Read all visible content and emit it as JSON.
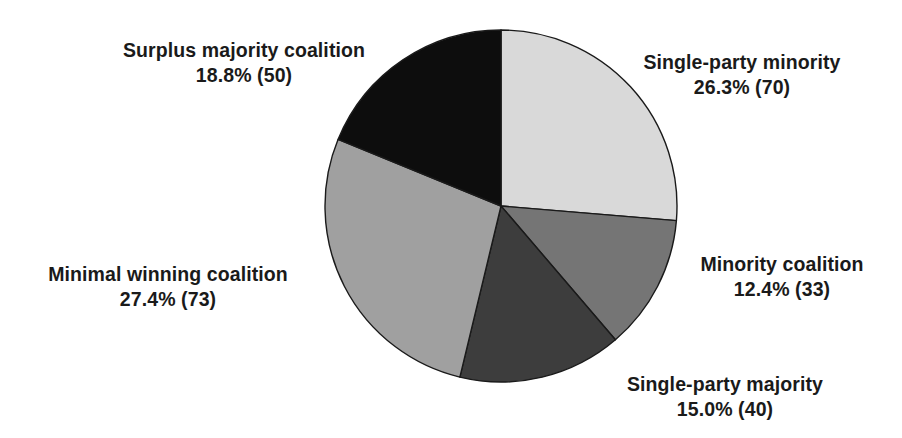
{
  "chart_data": {
    "type": "pie",
    "title": "",
    "subtitle": "",
    "xlabel": "",
    "ylabel": "",
    "legend_position": "none",
    "grid": false,
    "total_count": 266,
    "start_angle_deg": 0,
    "direction": "clockwise",
    "categories": [
      "Single-party minority",
      "Minority coalition",
      "Single-party majority",
      "Minimal winning coalition",
      "Surplus majority coalition"
    ],
    "values": [
      26.3,
      12.4,
      15.0,
      27.4,
      18.8
    ],
    "counts": [
      70,
      33,
      40,
      73,
      50
    ],
    "colors": [
      "#d9d9d9",
      "#757575",
      "#3d3d3d",
      "#a0a0a0",
      "#0d0d0d"
    ],
    "slice_edge_color": "#1a1a1a",
    "slices": [
      {
        "name": "Single-party minority",
        "percent": 26.3,
        "count": 70,
        "color": "#d9d9d9",
        "label_name": "Single-party minority",
        "label_value": "26.3% (70)"
      },
      {
        "name": "Minority coalition",
        "percent": 12.4,
        "count": 33,
        "color": "#757575",
        "label_name": "Minority coalition",
        "label_value": "12.4% (33)"
      },
      {
        "name": "Single-party majority",
        "percent": 15.0,
        "count": 40,
        "color": "#3d3d3d",
        "label_name": "Single-party majority",
        "label_value": "15.0% (40)"
      },
      {
        "name": "Minimal winning coalition",
        "percent": 27.4,
        "count": 73,
        "color": "#a0a0a0",
        "label_name": "Minimal winning coalition",
        "label_value": "27.4% (73)"
      },
      {
        "name": "Surplus majority coalition",
        "percent": 18.8,
        "count": 50,
        "color": "#0d0d0d",
        "label_name": "Surplus majority coalition",
        "label_value": "18.8% (50)"
      }
    ]
  },
  "labels": {
    "single_minority": {
      "name": "Single-party minority",
      "value": "26.3% (70)"
    },
    "minority_coalition": {
      "name": "Minority coalition",
      "value": "12.4% (33)"
    },
    "single_majority": {
      "name": "Single-party majority",
      "value": "15.0% (40)"
    },
    "minimal_winning": {
      "name": "Minimal winning coalition",
      "value": "27.4% (73)"
    },
    "surplus_majority": {
      "name": "Surplus majority coalition",
      "value": "18.8% (50)"
    }
  }
}
